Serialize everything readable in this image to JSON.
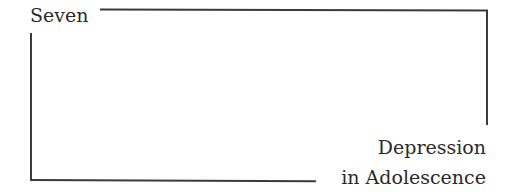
{
  "chapter": {
    "label": "Seven",
    "title_line_1": "Depression",
    "title_line_2": "in Adolescence"
  }
}
